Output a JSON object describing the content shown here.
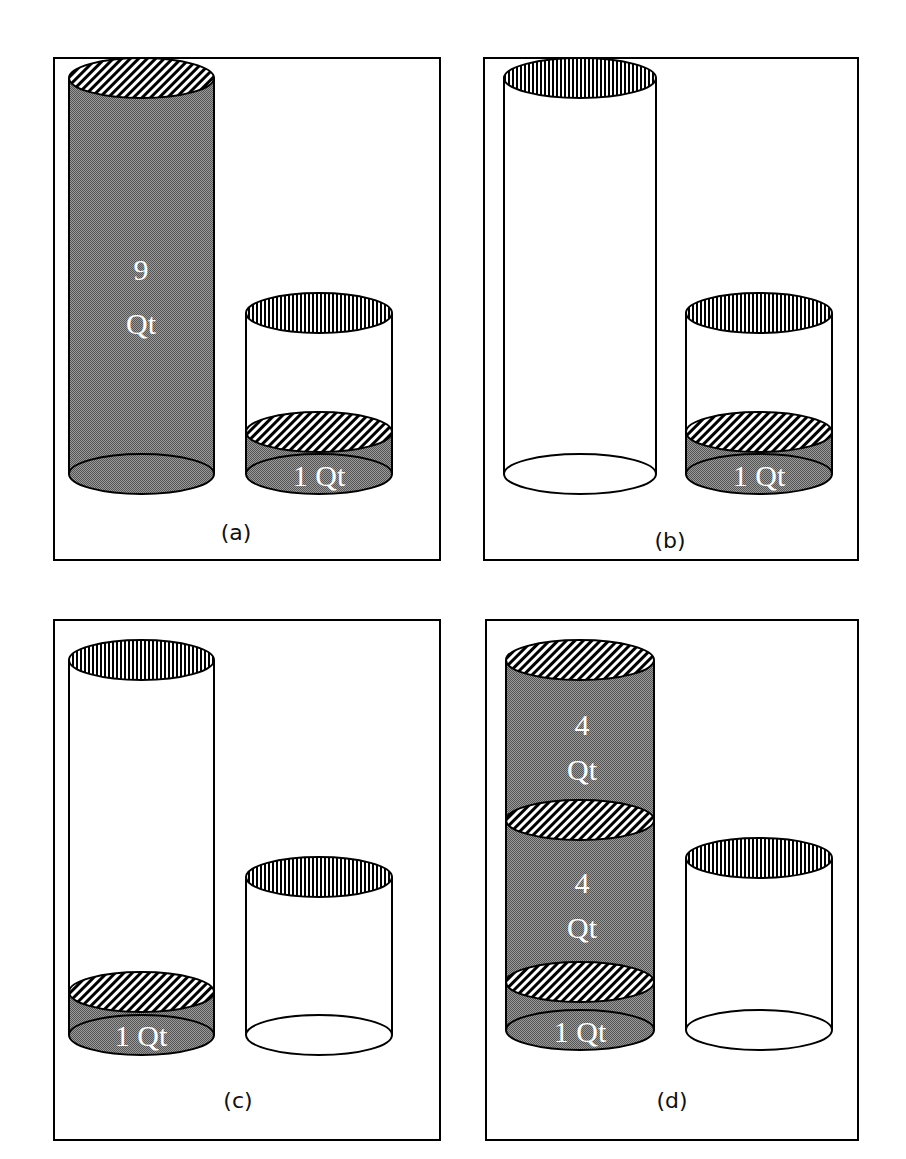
{
  "figure": {
    "panels": [
      {
        "id": "a",
        "caption": "(a)",
        "tall_container": {
          "filled": true,
          "labels": [
            {
              "line1": "9",
              "line2": "Qt"
            }
          ]
        },
        "short_container": {
          "filled_bottom": true,
          "label": "1  Qt"
        }
      },
      {
        "id": "b",
        "caption": "(b)",
        "tall_container": {
          "filled": false,
          "labels": []
        },
        "short_container": {
          "filled_bottom": true,
          "label": "1  Qt"
        }
      },
      {
        "id": "c",
        "caption": "(c)",
        "tall_container": {
          "filled_bottom": true,
          "label": "1  Qt"
        },
        "short_container": {
          "filled": false
        }
      },
      {
        "id": "d",
        "caption": "(d)",
        "tall_container": {
          "filled": true,
          "labels": [
            {
              "line1": "4",
              "line2": "Qt"
            },
            {
              "line1": "4",
              "line2": "Qt"
            }
          ],
          "bottom_label": "1  Qt"
        },
        "short_container": {
          "filled": false
        }
      }
    ],
    "colors": {
      "liquid": "#7a7a7a",
      "stroke": "#000000",
      "background": "#ffffff"
    }
  }
}
